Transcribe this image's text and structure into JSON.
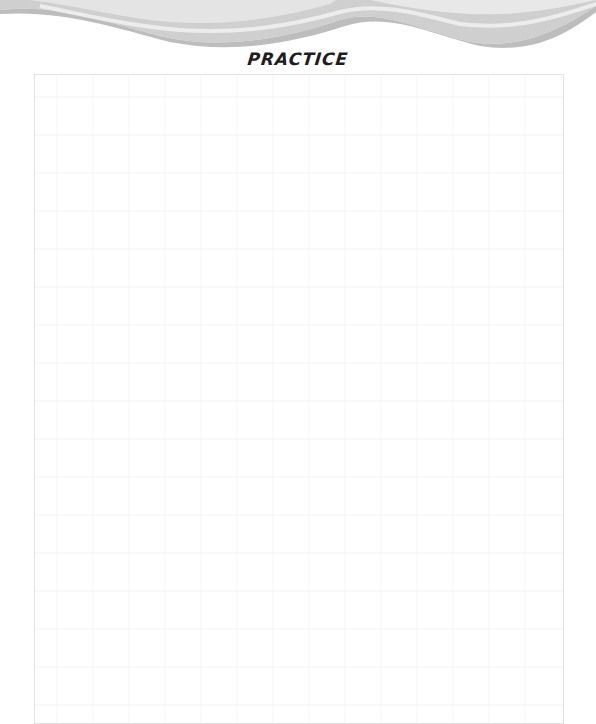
{
  "header": {
    "decoration": "gray-wave-band",
    "colors": {
      "wave_dark": "#c8c8c8",
      "wave_light": "#e6e6e6",
      "wave_highlight": "#f4f4f4"
    }
  },
  "page": {
    "title": "PRACTICE"
  },
  "practice_area": {
    "content": "blank writing area",
    "border_color": "#e2e2e2"
  }
}
